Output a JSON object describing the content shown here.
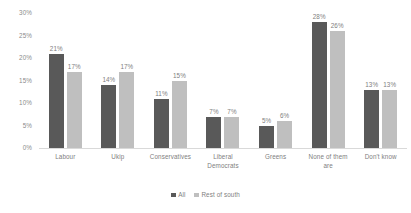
{
  "chart_data": {
    "type": "bar",
    "title": "",
    "subtitle": "",
    "xlabel": "",
    "ylabel": "",
    "ylim": [
      0,
      30
    ],
    "grid": false,
    "legend_position": "bottom-center",
    "value_suffix": "%",
    "yticks": [
      "0%",
      "5%",
      "10%",
      "15%",
      "20%",
      "25%",
      "30%"
    ],
    "ytick_values": [
      0,
      5,
      10,
      15,
      20,
      25,
      30
    ],
    "categories": [
      "Labour",
      "Ukip",
      "Conservatives",
      "Liberal Democrats",
      "Greens",
      "None of them are",
      "Don't know"
    ],
    "category_lines": [
      [
        "Labour"
      ],
      [
        "Ukip"
      ],
      [
        "Conservatives"
      ],
      [
        "Liberal",
        "Democrats"
      ],
      [
        "Greens"
      ],
      [
        "None of them",
        "are"
      ],
      [
        "Don't know"
      ]
    ],
    "series": [
      {
        "name": "All",
        "color": "#595959",
        "values": [
          21,
          14,
          11,
          7,
          5,
          28,
          13
        ],
        "labels": [
          "21%",
          "14%",
          "11%",
          "7%",
          "5%",
          "28%",
          "13%"
        ]
      },
      {
        "name": "Rest of south",
        "color": "#bfbfbf",
        "values": [
          17,
          17,
          15,
          7,
          6,
          26,
          13
        ],
        "labels": [
          "17%",
          "17%",
          "15%",
          "7%",
          "6%",
          "26%",
          "13%"
        ]
      }
    ]
  },
  "colors": {
    "series_all": "#595959",
    "series_rest_of_south": "#bfbfbf",
    "axis_text": "#808080",
    "axis_line": "#d9d9d9",
    "background": "#ffffff"
  }
}
